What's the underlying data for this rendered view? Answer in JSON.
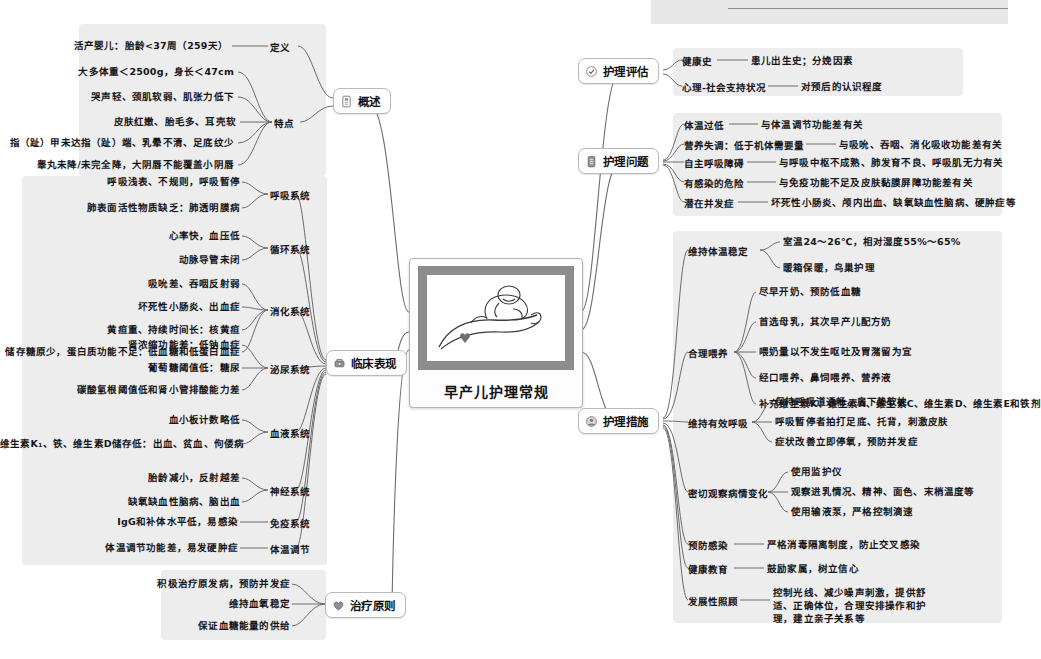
{
  "title": "早产儿护理常规",
  "central": {
    "label": "早产儿护理常规",
    "image_alt": "手掌托着熟睡的早产婴儿素描"
  },
  "branches": [
    {
      "id": "gaishu",
      "label": "概述",
      "icon": "document-icon",
      "side": "left",
      "subs": [
        {
          "label": "定义",
          "leaves": [
            "活产婴儿：胎龄<37周（259天）"
          ]
        },
        {
          "label": "特点",
          "leaves": [
            "大多体重＜2500g，身长＜47cm",
            "哭声轻、颈肌软弱、肌张力低下",
            "皮肤红嫩、胎毛多、耳壳软",
            "指（趾）甲未达指（趾）端、乳晕不清、足底纹少",
            "睾丸未降/未完全降，大阴唇不能覆盖小阴唇"
          ]
        }
      ]
    },
    {
      "id": "linchuang",
      "label": "临床表现",
      "icon": "stethoscope-icon",
      "side": "left",
      "subs": [
        {
          "label": "呼吸系统",
          "leaves": [
            "呼吸浅表、不规则，呼吸暂停",
            "肺表面活性物质缺乏：肺透明膜病"
          ]
        },
        {
          "label": "循环系统",
          "leaves": [
            "心率快，血压低",
            "动脉导管未闭"
          ]
        },
        {
          "label": "消化系统",
          "leaves": [
            "吸吮差、吞咽反射弱",
            "坏死性小肠炎、出血症",
            "黄疸重、持续时间长：核黄疸",
            "储存糖原少，蛋白质功能不足：低血糖和低蛋白血症"
          ]
        },
        {
          "label": "泌尿系统",
          "leaves": [
            "肾浓缩功能差：低钠血症",
            "葡萄糖阈值低：糖尿",
            "碳酸氢根阈值低和肾小管排酸能力差"
          ]
        },
        {
          "label": "血液系统",
          "leaves": [
            "血小板计数略低",
            "维生素K₁、铁、维生素D储存低：出血、贫血、佝偻病"
          ]
        },
        {
          "label": "神经系统",
          "leaves": [
            "胎龄减小，反射越差",
            "缺氧缺血性脑病、脑出血"
          ]
        },
        {
          "label": "免疫系统",
          "leaves": [
            "IgG和补体水平低，易感染"
          ]
        },
        {
          "label": "体温调节",
          "leaves": [
            "体温调节功能差，易发硬肿症"
          ]
        }
      ]
    },
    {
      "id": "zhiliao",
      "label": "治疗原则",
      "icon": "heart-icon",
      "side": "left",
      "subs": [
        {
          "label": "",
          "leaves": [
            "积极治疗原发病，预防并发症",
            "维持血氧稳定",
            "保证血糖能量的供给"
          ]
        }
      ]
    },
    {
      "id": "pinggu",
      "label": "护理评估",
      "icon": "check-circle-icon",
      "side": "right",
      "subs": [
        {
          "label": "健康史",
          "leaves": [
            "患儿出生史；分娩因素"
          ]
        },
        {
          "label": "心理-社会支持状况",
          "leaves": [
            "对预后的认识程度"
          ]
        }
      ]
    },
    {
      "id": "wenti",
      "label": "护理问题",
      "icon": "clipboard-icon",
      "side": "right",
      "subs": [
        {
          "label": "体温过低",
          "leaves": [
            "与体温调节功能差有关"
          ]
        },
        {
          "label": "营养失调：低于机体需要量",
          "leaves": [
            "与吸吮、吞咽、消化吸收功能差有关"
          ]
        },
        {
          "label": "自主呼吸障碍",
          "leaves": [
            "与呼吸中枢不成熟、肺发育不良、呼吸肌无力有关"
          ]
        },
        {
          "label": "有感染的危险",
          "leaves": [
            "与免疫功能不足及皮肤黏膜屏障功能差有关"
          ]
        },
        {
          "label": "潜在并发症",
          "leaves": [
            "坏死性小肠炎、颅内出血、缺氧缺血性脑病、硬肿症等"
          ]
        }
      ]
    },
    {
      "id": "cuoshi",
      "label": "护理措施",
      "icon": "nurse-icon",
      "side": "right",
      "subs": [
        {
          "label": "维持体温稳定",
          "leaves": [
            "室温24～26℃，相对湿度55%～65%",
            "暖箱保暖，鸟巢护理"
          ]
        },
        {
          "label": "合理喂养",
          "leaves": [
            "尽早开奶、预防低血糖",
            "首选母乳，其次早产儿配方奶",
            "喂奶量以不发生呕吐及胃潴留为宜",
            "经口喂养、鼻饲喂养、营养液",
            "补充维生素K、维生素A、维生素C、维生素D、维生素E和铁剂"
          ]
        },
        {
          "label": "维持有效呼吸",
          "leaves": [
            "保持呼吸道通畅，肩下垫软枕",
            "呼吸暂停者拍打足底、托背，刺激皮肤",
            "症状改善立即停氧，预防并发症"
          ]
        },
        {
          "label": "密切观察病情变化",
          "leaves": [
            "使用监护仪",
            "观察进乳情况、精神、面色、末梢温度等",
            "使用输液泵，严格控制滴速"
          ]
        },
        {
          "label": "预防感染",
          "leaves": [
            "严格消毒隔离制度，防止交叉感染"
          ]
        },
        {
          "label": "健康教育",
          "leaves": [
            "鼓励家属，树立信心"
          ]
        },
        {
          "label": "发展性照顾",
          "leaves": [
            "控制光线、减少噪声刺激，提供舒适、正确体位，合理安排操作和护理，建立亲子关系等"
          ]
        }
      ]
    }
  ],
  "colors": {
    "line": "#6b6b6b",
    "group_bg": "#dcdcdc",
    "node_bg": "#fdfdfd",
    "text": "#16161a"
  }
}
